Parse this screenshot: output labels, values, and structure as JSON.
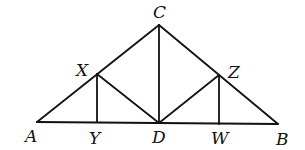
{
  "diagram": {
    "type": "geometry-truss",
    "stroke_color": "#111111",
    "background": "#ffffff",
    "points": {
      "A": {
        "x": 37,
        "y": 122
      },
      "Y": {
        "x": 97,
        "y": 122
      },
      "D": {
        "x": 159,
        "y": 123
      },
      "W": {
        "x": 219,
        "y": 124
      },
      "B": {
        "x": 278,
        "y": 124
      },
      "C": {
        "x": 159,
        "y": 25
      },
      "X": {
        "x": 97,
        "y": 74
      },
      "Z": {
        "x": 219,
        "y": 75
      }
    },
    "segments": [
      [
        "A",
        "B"
      ],
      [
        "A",
        "C"
      ],
      [
        "C",
        "B"
      ],
      [
        "C",
        "D"
      ],
      [
        "X",
        "Y"
      ],
      [
        "X",
        "D"
      ],
      [
        "D",
        "Z"
      ],
      [
        "Z",
        "W"
      ]
    ],
    "labels": [
      {
        "id": "C",
        "text": "C",
        "x": 153,
        "y": 18
      },
      {
        "id": "X",
        "text": "X",
        "x": 76,
        "y": 76
      },
      {
        "id": "Z",
        "text": "Z",
        "x": 228,
        "y": 78
      },
      {
        "id": "A",
        "text": "A",
        "x": 25,
        "y": 142
      },
      {
        "id": "Y",
        "text": "Y",
        "x": 89,
        "y": 144
      },
      {
        "id": "D",
        "text": "D",
        "x": 152,
        "y": 143
      },
      {
        "id": "W",
        "text": "W",
        "x": 211,
        "y": 144
      },
      {
        "id": "B",
        "text": "B",
        "x": 276,
        "y": 145
      }
    ]
  }
}
